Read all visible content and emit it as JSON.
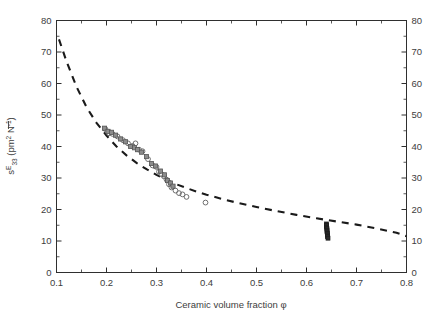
{
  "chart_data": {
    "type": "scatter",
    "title": "",
    "xlabel": "Ceramic volume fraction φ",
    "ylabel": "s̄ᴱ₃₃ (pm² N⁻¹)",
    "ylabel_left": "s̄ᴱ₃₃ (pm² N⁻¹)",
    "xlim": [
      0.1,
      0.8
    ],
    "ylim": [
      0,
      80
    ],
    "xticks": [
      0.1,
      0.2,
      0.3,
      0.4,
      0.5,
      0.6,
      0.7,
      0.8
    ],
    "xtick_labels": [
      "0.1",
      "0.2",
      "0.3",
      "0.4",
      "0.5",
      "0.6",
      "0.7",
      "0.8"
    ],
    "yticks": [
      0,
      10,
      20,
      30,
      40,
      50,
      60,
      70,
      80
    ],
    "ytick_labels": [
      "0",
      "10",
      "20",
      "30",
      "40",
      "50",
      "60",
      "70",
      "80"
    ],
    "right_axis_ticks": [
      0,
      10,
      20,
      30,
      40,
      50,
      60,
      70,
      80
    ],
    "right_axis_tick_labels": [
      "0",
      "10",
      "20",
      "30",
      "40",
      "50",
      "60",
      "70",
      "80"
    ],
    "x_minor_tick_step": 0.05,
    "y_minor_tick_step": 5,
    "grid": false,
    "legend": null,
    "legend_position": "none",
    "series": [
      {
        "name": "model fit",
        "type": "line",
        "style": "dashed",
        "color": "#1a1a1a",
        "x": [
          0.105,
          0.12,
          0.14,
          0.16,
          0.18,
          0.2,
          0.22,
          0.24,
          0.26,
          0.28,
          0.3,
          0.32,
          0.34,
          0.36,
          0.38,
          0.4,
          0.43,
          0.46,
          0.5,
          0.54,
          0.58,
          0.62,
          0.66,
          0.7,
          0.74,
          0.78,
          0.8
        ],
        "y": [
          74.0,
          67.0,
          59.0,
          52.5,
          47.5,
          43.5,
          40.0,
          37.2,
          34.8,
          32.8,
          31.0,
          29.4,
          28.0,
          26.8,
          25.7,
          24.7,
          23.4,
          22.2,
          20.8,
          19.5,
          18.3,
          17.2,
          16.2,
          15.2,
          14.0,
          12.6,
          11.5
        ]
      },
      {
        "name": "open circles",
        "type": "scatter",
        "marker": "circle-open",
        "color": "#6e6e6e",
        "x": [
          0.198,
          0.205,
          0.212,
          0.222,
          0.233,
          0.243,
          0.252,
          0.258,
          0.265,
          0.272,
          0.283,
          0.292,
          0.3,
          0.305,
          0.31,
          0.315,
          0.32,
          0.325,
          0.33,
          0.338,
          0.345,
          0.352,
          0.36,
          0.398
        ],
        "y": [
          45.5,
          44.2,
          44.0,
          43.2,
          42.0,
          41.0,
          40.2,
          41.0,
          39.0,
          38.5,
          36.0,
          34.0,
          33.5,
          32.0,
          31.2,
          30.5,
          29.5,
          28.0,
          27.0,
          26.0,
          25.2,
          24.8,
          24.0,
          22.2
        ]
      },
      {
        "name": "grey squares",
        "type": "scatter",
        "marker": "square-filled",
        "color": "#8c8c8c",
        "x": [
          0.196,
          0.203,
          0.21,
          0.218,
          0.228,
          0.238,
          0.248,
          0.256,
          0.262,
          0.27,
          0.28,
          0.29,
          0.298,
          0.308,
          0.316,
          0.322,
          0.328,
          0.333
        ],
        "y": [
          45.8,
          44.8,
          44.5,
          43.6,
          42.4,
          41.5,
          40.0,
          39.6,
          39.0,
          38.2,
          36.8,
          34.6,
          33.8,
          32.2,
          31.0,
          29.2,
          28.4,
          27.4
        ]
      },
      {
        "name": "dense cluster",
        "type": "scatter",
        "marker": "square-filled-dark",
        "color": "#2a2a2a",
        "x": [
          0.64,
          0.64,
          0.64,
          0.641,
          0.641,
          0.641,
          0.642,
          0.642,
          0.642,
          0.643
        ],
        "y": [
          15.4,
          14.9,
          14.4,
          13.9,
          13.4,
          12.9,
          12.4,
          11.9,
          11.4,
          10.9
        ]
      }
    ]
  },
  "figure": {
    "background_color": "#ffffff",
    "frame_color": "#2f2f2f",
    "text_color": "#3d3d3d",
    "accent_color": "#1a1a1a"
  }
}
